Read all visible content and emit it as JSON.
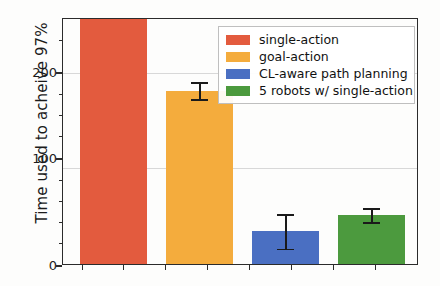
{
  "chart_data": {
    "type": "bar",
    "title": "",
    "xlabel": "",
    "ylabel": "Time used to acheive 97%",
    "categories": [
      "single-action",
      "goal-action",
      "CL-aware path planning",
      "5 robots w/ single-action"
    ],
    "values": [
      287,
      181,
      34,
      51
    ],
    "errors": [
      0,
      9,
      18,
      7
    ],
    "ylim": [
      0,
      256
    ],
    "yticks": [
      0,
      100,
      200
    ],
    "ytick_labels": [
      "0",
      "100",
      "200"
    ],
    "xticks": [],
    "xtick_labels": [],
    "grid": true,
    "legend_position": "upper right",
    "series": [
      {
        "name": "single-action",
        "value": 287,
        "error": 0,
        "color": "#E35B3E",
        "clipped": true
      },
      {
        "name": "goal-action",
        "value": 181,
        "error": 9,
        "color": "#F4AC3D",
        "clipped": false
      },
      {
        "name": "CL-aware path planning",
        "value": 34,
        "error": 18,
        "color": "#4A6FC2",
        "clipped": false
      },
      {
        "name": "5 robots w/ single-action",
        "value": 51,
        "error": 7,
        "color": "#4C9A3E",
        "clipped": false
      }
    ]
  },
  "axis": {
    "ylabel": "Time used to acheive 97%",
    "tick_200": "200",
    "tick_100": "100",
    "tick_0": "0"
  },
  "legend": {
    "items": [
      {
        "label": "single-action",
        "color": "#E35B3E"
      },
      {
        "label": "goal-action",
        "color": "#F4AC3D"
      },
      {
        "label": "CL-aware path planning",
        "color": "#4A6FC2"
      },
      {
        "label": "5 robots w/ single-action",
        "color": "#4C9A3E"
      }
    ]
  }
}
